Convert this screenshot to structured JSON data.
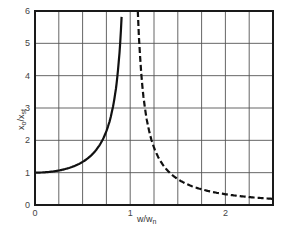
{
  "chart_data": {
    "type": "line",
    "title": "",
    "xlabel": "w/w_n",
    "ylabel": "x_o/x_st",
    "xlim": [
      0,
      2.5
    ],
    "ylim": [
      0,
      6
    ],
    "grid": true,
    "x_grid_step": 0.25,
    "y_grid_step": 1,
    "x_ticks": [
      0,
      1,
      2
    ],
    "x_tick_labels": [
      "0",
      "1",
      "2"
    ],
    "y_ticks": [
      0,
      1,
      2,
      3,
      4,
      5,
      6
    ],
    "y_tick_labels": [
      "0",
      "1",
      "2",
      "3",
      "4",
      "5",
      "6"
    ],
    "series": [
      {
        "name": "below resonance",
        "style": "solid",
        "x": [
          0,
          0.1,
          0.2,
          0.3,
          0.4,
          0.5,
          0.6,
          0.7,
          0.75,
          0.8,
          0.85,
          0.9,
          0.91
        ],
        "y": [
          1.0,
          1.01,
          1.04,
          1.1,
          1.19,
          1.33,
          1.56,
          1.96,
          2.29,
          2.78,
          3.6,
          5.26,
          5.82
        ]
      },
      {
        "name": "above resonance",
        "style": "dashed",
        "x": [
          1.08,
          1.1,
          1.15,
          1.2,
          1.3,
          1.4,
          1.5,
          1.6,
          1.8,
          2.0,
          2.2,
          2.5
        ],
        "y": [
          5.97,
          4.76,
          3.1,
          2.27,
          1.45,
          1.04,
          0.8,
          0.64,
          0.45,
          0.33,
          0.26,
          0.19
        ]
      }
    ],
    "legend": null
  },
  "labels": {
    "x_axis": "w/w",
    "x_axis_sub": "n",
    "y_axis_main": "x",
    "y_axis_sub1": "o",
    "y_axis_sep": "/x",
    "y_axis_sub2": "st"
  }
}
